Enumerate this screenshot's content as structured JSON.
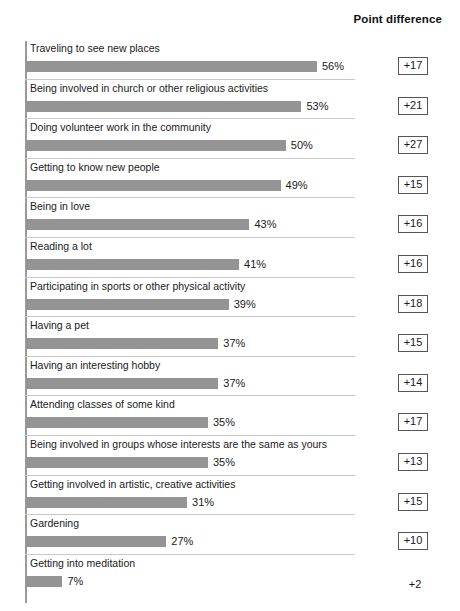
{
  "header": {
    "point_difference_label": "Point difference"
  },
  "chart_data": {
    "type": "bar",
    "title": "",
    "subtitle": "",
    "xlabel": "",
    "ylabel": "",
    "orientation": "horizontal",
    "grid": false,
    "legend": "none",
    "xlim": [
      0,
      56
    ],
    "value_suffix": "%",
    "columns": [
      "Activity",
      "Percent",
      "Point difference"
    ],
    "categories": [
      "Traveling to see new places",
      "Being involved in church or other religious activities",
      "Doing volunteer work in the community",
      "Getting to know new people",
      "Being in love",
      "Reading a lot",
      "Participating in sports or other physical activity",
      "Having a pet",
      "Having an interesting hobby",
      "Attending classes of some kind",
      "Being involved in groups whose interests are the same as yours",
      "Getting involved in artistic, creative activities",
      "Gardening",
      "Getting into meditation"
    ],
    "values": [
      56,
      53,
      50,
      49,
      43,
      41,
      39,
      37,
      37,
      35,
      35,
      31,
      27,
      7
    ],
    "value_labels": [
      "56%",
      "53%",
      "50%",
      "49%",
      "43%",
      "41%",
      "39%",
      "37%",
      "37%",
      "35%",
      "35%",
      "31%",
      "27%",
      "7%"
    ],
    "point_differences": [
      17,
      21,
      27,
      15,
      16,
      16,
      18,
      15,
      14,
      17,
      13,
      15,
      10,
      2
    ],
    "point_difference_labels": [
      "+17",
      "+21",
      "+27",
      "+15",
      "+16",
      "+16",
      "+18",
      "+15",
      "+14",
      "+17",
      "+13",
      "+15",
      "+10",
      "+2"
    ],
    "series": [
      {
        "name": "Percent",
        "values": [
          56,
          53,
          50,
          49,
          43,
          41,
          39,
          37,
          37,
          35,
          35,
          31,
          27,
          7
        ]
      }
    ],
    "colors": {
      "bar": "#949494",
      "axis": "#9a9a9a",
      "rule": "#c9c9c9",
      "text": "#1a1a1a",
      "box_border": "#555555",
      "background": "#ffffff"
    }
  },
  "rows": [
    {
      "label": "Traveling to see new places",
      "value": 56,
      "value_label": "56%",
      "diff_label": "+17",
      "boxed": true
    },
    {
      "label": "Being involved in church or other religious activities",
      "value": 53,
      "value_label": "53%",
      "diff_label": "+21",
      "boxed": true
    },
    {
      "label": "Doing volunteer work in the community",
      "value": 50,
      "value_label": "50%",
      "diff_label": "+27",
      "boxed": true
    },
    {
      "label": "Getting to know new people",
      "value": 49,
      "value_label": "49%",
      "diff_label": "+15",
      "boxed": true
    },
    {
      "label": "Being in love",
      "value": 43,
      "value_label": "43%",
      "diff_label": "+16",
      "boxed": true
    },
    {
      "label": "Reading a lot",
      "value": 41,
      "value_label": "41%",
      "diff_label": "+16",
      "boxed": true
    },
    {
      "label": "Participating in sports or other physical activity",
      "value": 39,
      "value_label": "39%",
      "diff_label": "+18",
      "boxed": true
    },
    {
      "label": "Having a pet",
      "value": 37,
      "value_label": "37%",
      "diff_label": "+15",
      "boxed": true
    },
    {
      "label": "Having an interesting hobby",
      "value": 37,
      "value_label": "37%",
      "diff_label": "+14",
      "boxed": true
    },
    {
      "label": "Attending classes of some kind",
      "value": 35,
      "value_label": "35%",
      "diff_label": "+17",
      "boxed": true
    },
    {
      "label": "Being involved in groups whose interests are the same as yours",
      "value": 35,
      "value_label": "35%",
      "diff_label": "+13",
      "boxed": true
    },
    {
      "label": "Getting involved in artistic, creative activities",
      "value": 31,
      "value_label": "31%",
      "diff_label": "+15",
      "boxed": true
    },
    {
      "label": "Gardening",
      "value": 27,
      "value_label": "27%",
      "diff_label": "+10",
      "boxed": true
    },
    {
      "label": "Getting into meditation",
      "value": 7,
      "value_label": "7%",
      "diff_label": "+2",
      "boxed": false
    }
  ]
}
